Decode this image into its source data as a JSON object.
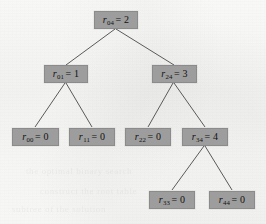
{
  "figure": {
    "type": "binary-tree-diagram",
    "node_fill_color": "#9d9d9d",
    "node_border_color": "#8b8b8b",
    "edge_color": "#5a5a5a",
    "background_color": "#f8f8f7",
    "text_color": "#111111"
  },
  "nodes": [
    {
      "id": "r04",
      "var": "r",
      "subscript": "04",
      "equals": "=",
      "value": "2",
      "label": "r04 = 2",
      "level": 0
    },
    {
      "id": "r01",
      "var": "r",
      "subscript": "01",
      "equals": "=",
      "value": "1",
      "label": "r01 = 1",
      "level": 1
    },
    {
      "id": "r24",
      "var": "r",
      "subscript": "24",
      "equals": "=",
      "value": "3",
      "label": "r24 = 3",
      "level": 1
    },
    {
      "id": "r00",
      "var": "r",
      "subscript": "00",
      "equals": "=",
      "value": "0",
      "label": "r00 = 0",
      "level": 2
    },
    {
      "id": "r11",
      "var": "r",
      "subscript": "11",
      "equals": "=",
      "value": "0",
      "label": "r11 = 0",
      "level": 2
    },
    {
      "id": "r22",
      "var": "r",
      "subscript": "22",
      "equals": "=",
      "value": "0",
      "label": "r22 = 0",
      "level": 2
    },
    {
      "id": "r34",
      "var": "r",
      "subscript": "34",
      "equals": "=",
      "value": "4",
      "label": "r34 = 4",
      "level": 2
    },
    {
      "id": "r33",
      "var": "r",
      "subscript": "33",
      "equals": "=",
      "value": "0",
      "label": "r33 = 0",
      "level": 3
    },
    {
      "id": "r44",
      "var": "r",
      "subscript": "44",
      "equals": "=",
      "value": "0",
      "label": "r44 = 0",
      "level": 3
    }
  ],
  "edges": [
    {
      "from": "r04",
      "to": "r01"
    },
    {
      "from": "r04",
      "to": "r24"
    },
    {
      "from": "r01",
      "to": "r00"
    },
    {
      "from": "r01",
      "to": "r11"
    },
    {
      "from": "r24",
      "to": "r22"
    },
    {
      "from": "r24",
      "to": "r34"
    },
    {
      "from": "r34",
      "to": "r33"
    },
    {
      "from": "r34",
      "to": "r44"
    }
  ],
  "background_bleed_text": [
    {
      "text": "the optimal binary search"
    },
    {
      "text": "construct the root table"
    },
    {
      "text": "subtree of the solution"
    }
  ]
}
